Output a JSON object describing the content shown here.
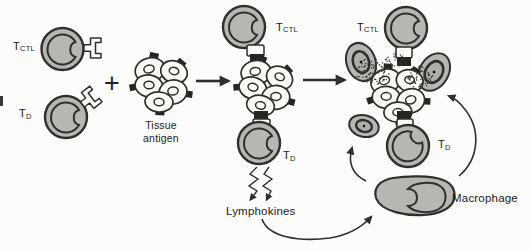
{
  "figure": {
    "labels": {
      "t": "T",
      "ctl": "CTL",
      "d": "D",
      "plus": "+",
      "tissue_antigen": [
        "Tissue",
        "antigen"
      ],
      "lymphokines": "Lymphokines",
      "macrophage": "Macrophage"
    },
    "colors": {
      "background": "#fcfcfa",
      "cell_fill": "#b6b6b3",
      "outline": "#2f2f2d",
      "tissue_cell_fill": "#fafaf7",
      "antigen_square": "#242422",
      "text": "#1b1b19"
    }
  }
}
